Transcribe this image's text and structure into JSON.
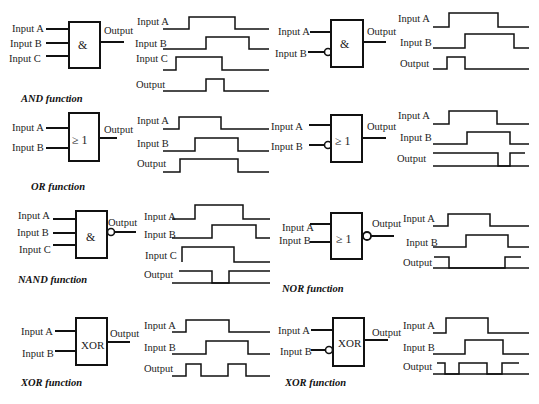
{
  "panels": [
    {
      "id": "and3",
      "title": "AND function",
      "symbol": "&",
      "inputs": [
        "Input A",
        "Input B",
        "Input C"
      ],
      "output": "Output",
      "inverted_inputs": [],
      "inverted_output": false
    },
    {
      "id": "and-notb",
      "title": "",
      "symbol": "&",
      "inputs": [
        "Input A",
        "Input B"
      ],
      "output": "Output",
      "inverted_inputs": [
        "Input B"
      ],
      "inverted_output": false
    },
    {
      "id": "or",
      "title": "OR function",
      "symbol": "≥ 1",
      "inputs": [
        "Input A",
        "Input B"
      ],
      "output": "Output",
      "inverted_inputs": [],
      "inverted_output": false
    },
    {
      "id": "or-notb",
      "title": "",
      "symbol": "≥ 1",
      "inputs": [
        "Input A",
        "Input B"
      ],
      "output": "Output",
      "inverted_inputs": [
        "Input B"
      ],
      "inverted_output": false
    },
    {
      "id": "nand",
      "title": "NAND function",
      "symbol": "&",
      "inputs": [
        "Input A",
        "Input B",
        "Input C"
      ],
      "output": "Output",
      "inverted_inputs": [],
      "inverted_output": true
    },
    {
      "id": "nor",
      "title": "NOR function",
      "symbol": "≥ 1",
      "inputs": [
        "Input A",
        "Input B"
      ],
      "output": "Output",
      "inverted_inputs": [],
      "inverted_output": true
    },
    {
      "id": "xor",
      "title": "XOR function",
      "symbol": "XOR",
      "inputs": [
        "Input A",
        "Input B"
      ],
      "output": "Output",
      "inverted_inputs": [],
      "inverted_output": false
    },
    {
      "id": "xor-notb",
      "title": "XOR function",
      "symbol": "XOR",
      "inputs": [
        "Input A",
        "Input B"
      ],
      "output": "Output",
      "inverted_inputs": [
        "Input B"
      ],
      "inverted_output": false
    }
  ],
  "labels": {
    "a": "Input A",
    "b": "Input B",
    "c": "Input C",
    "out": "Output",
    "and": "&",
    "or": "≥ 1",
    "xor": "XOR",
    "t_and": "AND function",
    "t_or": "OR function",
    "t_nand": "NAND function",
    "t_nor": "NOR function",
    "t_xor": "XOR function",
    "t_xor2": "XOR function"
  }
}
